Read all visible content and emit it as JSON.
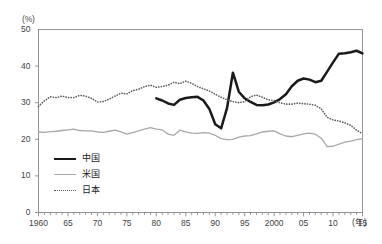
{
  "chart_data": {
    "type": "line",
    "title": "",
    "subtitle": "",
    "xlabel": "年",
    "ylabel": "(%)",
    "unit_label": "(%)",
    "xaxis_unit": "(年)",
    "grid": false,
    "legend_position": "inside-lower-left",
    "xlim": [
      1960,
      2015
    ],
    "ylim": [
      0,
      50
    ],
    "ytick_labels": [
      "0",
      "10",
      "20",
      "30",
      "40",
      "50"
    ],
    "ytick_values": [
      0,
      10,
      20,
      30,
      40,
      50
    ],
    "xtick_labels": [
      "1960",
      "65",
      "70",
      "75",
      "80",
      "85",
      "90",
      "95",
      "2000",
      "05",
      "10",
      "15"
    ],
    "xtick_values": [
      1960,
      1965,
      1970,
      1975,
      1980,
      1985,
      1990,
      1995,
      2000,
      2005,
      2010,
      2015
    ],
    "minor_tick_interval": 1,
    "colors": {
      "china": "#1a1a1a",
      "usa": "#a8a8a8",
      "japan": "#5a5a5a",
      "axis": "#8a8a8a",
      "text": "#3f3f3f",
      "background": "#ffffff"
    },
    "series": [
      {
        "name": "中国",
        "key": "china",
        "style": "solid-thick",
        "color": "#1a1a1a",
        "x": [
          1980,
          1981,
          1982,
          1983,
          1984,
          1985,
          1986,
          1987,
          1988,
          1989,
          1990,
          1991,
          1992,
          1993,
          1994,
          1995,
          1996,
          1997,
          1998,
          1999,
          2000,
          2001,
          2002,
          2003,
          2004,
          2005,
          2006,
          2007,
          2008,
          2009,
          2010,
          2011,
          2012,
          2013,
          2014,
          2015
        ],
        "values": [
          31.2,
          30.6,
          29.8,
          29.4,
          30.8,
          31.3,
          31.5,
          31.6,
          30.6,
          28.3,
          24.1,
          23.0,
          28.5,
          38.2,
          33.0,
          31.2,
          30.2,
          29.4,
          29.3,
          29.5,
          30.1,
          31.0,
          32.3,
          34.5,
          36.0,
          36.6,
          36.3,
          35.6,
          36.0,
          38.5,
          41.0,
          43.4,
          43.5,
          43.8,
          44.2,
          43.5
        ]
      },
      {
        "name": "米国",
        "key": "usa",
        "style": "solid-thin",
        "color": "#a8a8a8",
        "x": [
          1960,
          1961,
          1962,
          1963,
          1964,
          1965,
          1966,
          1967,
          1968,
          1969,
          1970,
          1971,
          1972,
          1973,
          1974,
          1975,
          1976,
          1977,
          1978,
          1979,
          1980,
          1981,
          1982,
          1983,
          1984,
          1985,
          1986,
          1987,
          1988,
          1989,
          1990,
          1991,
          1992,
          1993,
          1994,
          1995,
          1996,
          1997,
          1998,
          1999,
          2000,
          2001,
          2002,
          2003,
          2004,
          2005,
          2006,
          2007,
          2008,
          2009,
          2010,
          2011,
          2012,
          2013,
          2014,
          2015
        ],
        "values": [
          22.0,
          21.9,
          22.1,
          22.2,
          22.4,
          22.6,
          22.8,
          22.4,
          22.3,
          22.3,
          22.0,
          21.9,
          22.2,
          22.5,
          22.0,
          21.4,
          21.8,
          22.3,
          22.8,
          23.2,
          22.8,
          22.6,
          21.4,
          21.1,
          22.5,
          22.0,
          21.7,
          21.6,
          21.8,
          21.7,
          21.1,
          20.2,
          19.9,
          20.0,
          20.6,
          20.9,
          21.0,
          21.5,
          22.0,
          22.2,
          22.3,
          21.5,
          20.9,
          20.7,
          21.1,
          21.5,
          21.7,
          21.4,
          20.3,
          18.0,
          18.1,
          18.7,
          19.2,
          19.5,
          19.9,
          20.2
        ]
      },
      {
        "name": "日本",
        "key": "japan",
        "style": "dotted",
        "color": "#5a5a5a",
        "x": [
          1960,
          1961,
          1962,
          1963,
          1964,
          1965,
          1966,
          1967,
          1968,
          1969,
          1970,
          1971,
          1972,
          1973,
          1974,
          1975,
          1976,
          1977,
          1978,
          1979,
          1980,
          1981,
          1982,
          1983,
          1984,
          1985,
          1986,
          1987,
          1988,
          1989,
          1990,
          1991,
          1992,
          1993,
          1994,
          1995,
          1996,
          1997,
          1998,
          1999,
          2000,
          2001,
          2002,
          2003,
          2004,
          2005,
          2006,
          2007,
          2008,
          2009,
          2010,
          2011,
          2012,
          2013,
          2014,
          2015
        ],
        "values": [
          29.0,
          30.5,
          31.6,
          31.4,
          31.8,
          31.4,
          31.4,
          32.0,
          31.8,
          31.2,
          30.2,
          30.3,
          31.0,
          31.8,
          32.6,
          32.4,
          33.3,
          33.7,
          34.4,
          34.8,
          34.2,
          34.4,
          34.8,
          35.6,
          35.2,
          35.9,
          35.3,
          34.4,
          33.8,
          33.2,
          32.3,
          31.5,
          30.8,
          30.3,
          30.0,
          30.3,
          31.6,
          32.1,
          31.5,
          30.8,
          30.6,
          30.0,
          29.6,
          29.6,
          29.9,
          29.7,
          29.6,
          29.3,
          28.3,
          26.0,
          25.3,
          25.0,
          24.5,
          23.8,
          22.5,
          21.5
        ]
      }
    ]
  },
  "legend": {
    "items": [
      {
        "label": "中国",
        "key": "china"
      },
      {
        "label": "米国",
        "key": "usa"
      },
      {
        "label": "日本",
        "key": "japan"
      }
    ]
  }
}
